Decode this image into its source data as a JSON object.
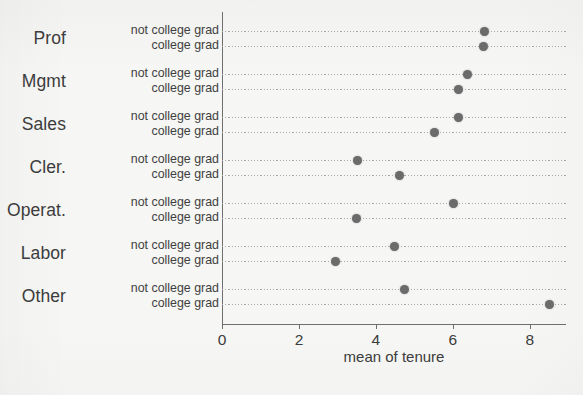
{
  "chart_data": {
    "type": "scatter",
    "title": "",
    "xlabel": "mean of tenure",
    "ylabel": "",
    "xlim": [
      0,
      8.94
    ],
    "ylim": [
      0,
      7
    ],
    "grid": true,
    "grid_style": "dotted-horizontal",
    "legend": "none",
    "orientation": "horizontal",
    "point_color": "#6b6b6b",
    "axis_color": "#6f6f6f",
    "background_color": "#f6f6f4",
    "xticks": [
      0,
      2,
      4,
      6,
      8
    ],
    "xtick_labels": [
      "0",
      "2",
      "4",
      "6",
      "8"
    ],
    "categories": [
      "Prof",
      "Mgmt",
      "Sales",
      "Cler.",
      "Operat.",
      "Labor",
      "Other"
    ],
    "series": [
      {
        "name": "not college grad",
        "values": [
          6.83,
          6.38,
          6.15,
          3.51,
          6.01,
          4.49,
          4.73
        ]
      },
      {
        "name": "college grad",
        "values": [
          6.79,
          6.14,
          5.53,
          4.62,
          3.5,
          2.96,
          8.5
        ]
      }
    ],
    "groups": [
      {
        "category": "Prof",
        "rows": [
          {
            "label": "not college grad",
            "value": 6.83
          },
          {
            "label": "college grad",
            "value": 6.79
          }
        ]
      },
      {
        "category": "Mgmt",
        "rows": [
          {
            "label": "not college grad",
            "value": 6.38
          },
          {
            "label": "college grad",
            "value": 6.14
          }
        ]
      },
      {
        "category": "Sales",
        "rows": [
          {
            "label": "not college grad",
            "value": 6.15
          },
          {
            "label": "college grad",
            "value": 5.53
          }
        ]
      },
      {
        "category": "Cler.",
        "rows": [
          {
            "label": "not college grad",
            "value": 3.51
          },
          {
            "label": "college grad",
            "value": 4.62
          }
        ]
      },
      {
        "category": "Operat.",
        "rows": [
          {
            "label": "not college grad",
            "value": 6.01
          },
          {
            "label": "college grad",
            "value": 3.5
          }
        ]
      },
      {
        "category": "Labor",
        "rows": [
          {
            "label": "not college grad",
            "value": 4.49
          },
          {
            "label": "college grad",
            "value": 2.96
          }
        ]
      },
      {
        "category": "Other",
        "rows": [
          {
            "label": "not college grad",
            "value": 4.73
          },
          {
            "label": "college grad",
            "value": 8.5
          }
        ]
      }
    ]
  }
}
